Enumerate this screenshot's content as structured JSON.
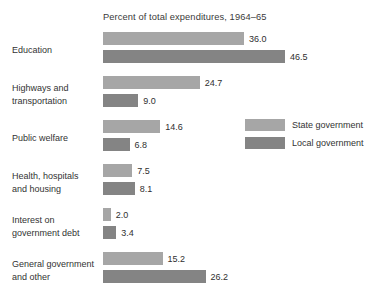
{
  "chart_data": {
    "type": "bar",
    "orientation": "horizontal",
    "title": "Percent of total expenditures, 1964–65",
    "xlabel": "",
    "ylabel": "",
    "grid": false,
    "xlim": [
      0,
      46.5
    ],
    "legend_position": "right-middle",
    "categories": [
      "Education",
      "Highways and\ntransportation",
      "Public welfare",
      "Health, hospitals\nand housing",
      "Interest on\ngovernment debt",
      "General government\nand other"
    ],
    "series": [
      {
        "name": "State government",
        "color": "#a6a6a6",
        "values": [
          36.0,
          24.7,
          14.6,
          7.5,
          2.0,
          15.2
        ],
        "value_labels": [
          "36.0",
          "24.7",
          "14.6",
          "7.5",
          "2.0",
          "15.2"
        ]
      },
      {
        "name": "Local government",
        "color": "#848484",
        "values": [
          46.5,
          9.0,
          6.8,
          8.1,
          3.4,
          26.2
        ],
        "value_labels": [
          "46.5",
          "9.0",
          "6.8",
          "8.1",
          "3.4",
          "26.2"
        ]
      }
    ]
  },
  "legend": {
    "items": [
      {
        "label": "State government",
        "color": "#a6a6a6"
      },
      {
        "label": "Local government",
        "color": "#848484"
      }
    ]
  }
}
